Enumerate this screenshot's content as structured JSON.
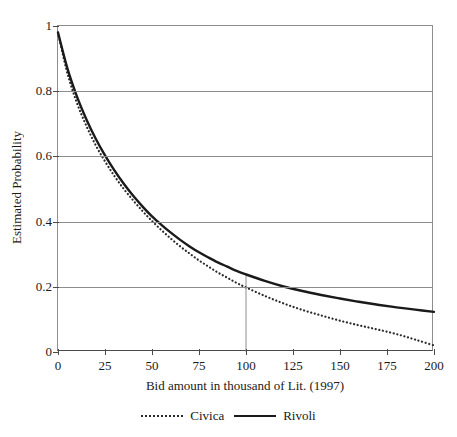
{
  "figure": {
    "title_remnant": "",
    "background": "#ffffff"
  },
  "axes": {
    "y_title": "Estimated Probability",
    "x_title": "Bid amount in thousand of Lit. (1997)",
    "y_ticks": [
      "0",
      "0.2",
      "0.4",
      "0.6",
      "0.8",
      "1"
    ],
    "x_ticks": [
      "0",
      "25",
      "50",
      "75",
      "100",
      "125",
      "150",
      "175",
      "200"
    ]
  },
  "legend": {
    "entries": [
      {
        "label": "Civica",
        "style": "dotted",
        "color": "#2a2a2a"
      },
      {
        "label": "Rivoli",
        "style": "solid",
        "color": "#1a1a1a"
      }
    ]
  },
  "chart_data": {
    "type": "line",
    "title": "",
    "xlabel": "Bid amount in thousand of Lit. (1997)",
    "ylabel": "Estimated Probability",
    "xlim": [
      0,
      200
    ],
    "ylim": [
      0,
      1
    ],
    "xticks": [
      0,
      25,
      50,
      75,
      100,
      125,
      150,
      175,
      200
    ],
    "yticks": [
      0,
      0.2,
      0.4,
      0.6,
      0.8,
      1
    ],
    "grid": "horizontal",
    "legend_position": "bottom-center",
    "x": [
      0,
      5,
      10,
      15,
      20,
      25,
      30,
      35,
      40,
      45,
      50,
      55,
      60,
      65,
      70,
      75,
      80,
      85,
      90,
      95,
      100,
      110,
      120,
      130,
      140,
      150,
      160,
      170,
      180,
      190,
      200
    ],
    "series": [
      {
        "name": "Civica",
        "style": "dotted",
        "color": "#2a2a2a",
        "values": [
          0.98,
          0.855,
          0.765,
          0.695,
          0.635,
          0.585,
          0.54,
          0.5,
          0.465,
          0.432,
          0.402,
          0.374,
          0.348,
          0.324,
          0.302,
          0.281,
          0.262,
          0.244,
          0.228,
          0.212,
          0.198,
          0.172,
          0.149,
          0.129,
          0.112,
          0.096,
          0.082,
          0.069,
          0.055,
          0.038,
          0.02
        ]
      },
      {
        "name": "Rivoli",
        "style": "solid",
        "color": "#1a1a1a",
        "values": [
          0.98,
          0.87,
          0.785,
          0.715,
          0.655,
          0.603,
          0.557,
          0.516,
          0.479,
          0.446,
          0.416,
          0.39,
          0.366,
          0.344,
          0.324,
          0.306,
          0.29,
          0.275,
          0.262,
          0.249,
          0.238,
          0.218,
          0.201,
          0.187,
          0.175,
          0.164,
          0.154,
          0.145,
          0.137,
          0.13,
          0.123
        ]
      }
    ],
    "annotations": [
      {
        "type": "vertical-reference-line",
        "x": 100,
        "y_from": 0,
        "y_to": 0.238,
        "color": "#8d8d8d"
      }
    ]
  }
}
